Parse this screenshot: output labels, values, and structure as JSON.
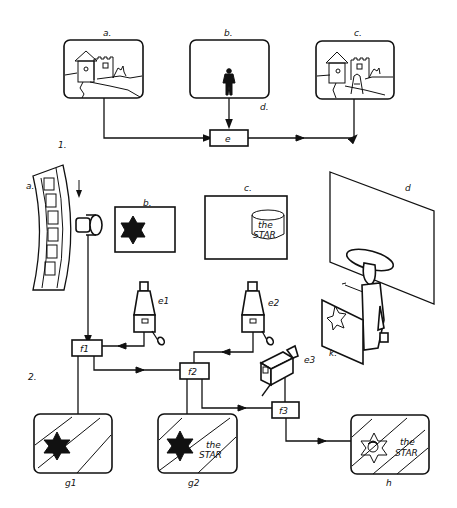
{
  "figure": {
    "colors": {
      "ink": "#111111",
      "background": "#ffffff"
    },
    "part1": {
      "section_label": "1.",
      "screens": [
        {
          "id": "a",
          "label": "a.",
          "content": "castle-background-scene"
        },
        {
          "id": "b",
          "label": "b.",
          "content": "actor-figure"
        },
        {
          "id": "c",
          "label": "c.",
          "content": "composite-castle-with-actor"
        }
      ],
      "signal_label": "d.",
      "mixer": {
        "id": "e",
        "label": "e"
      }
    },
    "part2": {
      "section_label": "2.",
      "film_strip": {
        "label": "a."
      },
      "card_b": {
        "label": "b.",
        "content": "six-pointed-star"
      },
      "card_c": {
        "label": "c.",
        "line1": "the",
        "line2": "STAR"
      },
      "backdrop": {
        "label": "d"
      },
      "foreground_panel": {
        "label": "k."
      },
      "cameras": [
        {
          "id": "e1",
          "label": "e1"
        },
        {
          "id": "e2",
          "label": "e2"
        },
        {
          "id": "e3",
          "label": "e3"
        }
      ],
      "mixers": [
        {
          "id": "f1",
          "label": "f1"
        },
        {
          "id": "f2",
          "label": "f2"
        },
        {
          "id": "f3",
          "label": "f3"
        }
      ],
      "outputs": [
        {
          "id": "g1",
          "label": "g1"
        },
        {
          "id": "g2",
          "label": "g2",
          "line1": "the",
          "line2": "STAR"
        },
        {
          "id": "h",
          "label": "h",
          "line1": "the",
          "line2": "STAR"
        }
      ]
    }
  }
}
